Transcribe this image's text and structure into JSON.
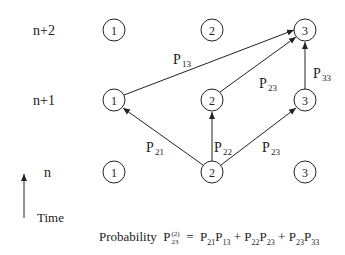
{
  "diagram": {
    "rows": [
      {
        "label": "n+2",
        "y": 30
      },
      {
        "label": "n+1",
        "y": 100
      },
      {
        "label": "n",
        "y": 172
      }
    ],
    "states": [
      "1",
      "2",
      "3"
    ],
    "state_x": [
      114,
      212,
      305
    ],
    "edges": [
      {
        "from": "n+1:1",
        "to": "n+2:3",
        "label": "P",
        "sub": "13"
      },
      {
        "from": "n+1:2",
        "to": "n+2:3",
        "label": "P",
        "sub": "23"
      },
      {
        "from": "n+1:3",
        "to": "n+2:3",
        "label": "P",
        "sub": "33"
      },
      {
        "from": "n:2",
        "to": "n+1:1",
        "label": "P",
        "sub": "21"
      },
      {
        "from": "n:2",
        "to": "n+1:2",
        "label": "P",
        "sub": "22"
      },
      {
        "from": "n:2",
        "to": "n+1:3",
        "label": "P",
        "sub": "23"
      }
    ],
    "time_axis_label": "Time",
    "formula": {
      "prefix": "Probability",
      "lhs_base": "P",
      "lhs_sup": "(2)",
      "lhs_sub": "23",
      "equals": "=",
      "rhs": "P21P13 + P22P23 + P23P33",
      "terms": [
        [
          "21",
          "13"
        ],
        [
          "22",
          "23"
        ],
        [
          "23",
          "33"
        ]
      ]
    }
  }
}
